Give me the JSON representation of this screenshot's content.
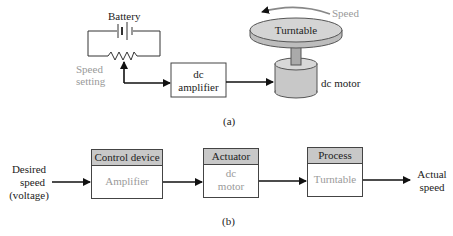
{
  "part_a": {
    "battery_label": "Battery",
    "speed_setting_label_line1": "Speed",
    "speed_setting_label_line2": "setting",
    "amplifier_line1": "dc",
    "amplifier_line2": "amplifier",
    "turntable_label": "Turntable",
    "speed_label": "Speed",
    "motor_label": "dc motor",
    "caption": "(a)"
  },
  "part_b": {
    "input_line1": "Desired",
    "input_line2": "speed",
    "input_line3": "(voltage)",
    "blocks": [
      {
        "header": "Control device",
        "body_line1": "Amplifier",
        "body_line2": ""
      },
      {
        "header": "Actuator",
        "body_line1": "dc",
        "body_line2": "motor"
      },
      {
        "header": "Process",
        "body_line1": "Turntable",
        "body_line2": ""
      }
    ],
    "output_line1": "Actual",
    "output_line2": "speed",
    "caption": "(b)"
  },
  "colors": {
    "header_fill": "#c8c8c8",
    "gray_text": "#9a9a9a",
    "component_fill": "#c8c8c8"
  }
}
